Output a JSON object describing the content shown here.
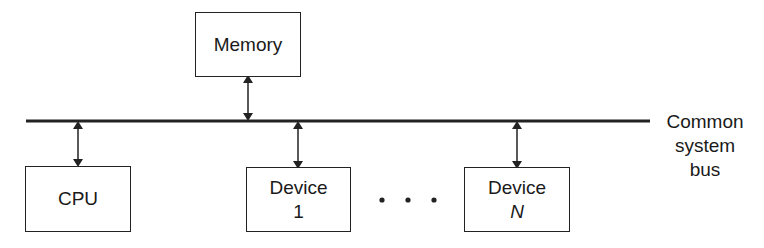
{
  "diagram": {
    "type": "bus-architecture",
    "nodes": {
      "memory": {
        "label": "Memory"
      },
      "cpu": {
        "label": "CPU"
      },
      "device1": {
        "line1": "Device",
        "line2": "1"
      },
      "deviceN": {
        "line1": "Device",
        "line2": "N"
      }
    },
    "ellipsis": "• • •",
    "bus": {
      "line1": "Common",
      "line2": "system",
      "line3": "bus"
    },
    "edges": [
      {
        "from": "memory",
        "to": "bus",
        "style": "bidirectional-arrow"
      },
      {
        "from": "cpu",
        "to": "bus",
        "style": "bidirectional-arrow"
      },
      {
        "from": "device1",
        "to": "bus",
        "style": "bidirectional-arrow"
      },
      {
        "from": "deviceN",
        "to": "bus",
        "style": "bidirectional-arrow"
      }
    ],
    "colors": {
      "stroke": "#222222",
      "background": "#ffffff"
    }
  }
}
